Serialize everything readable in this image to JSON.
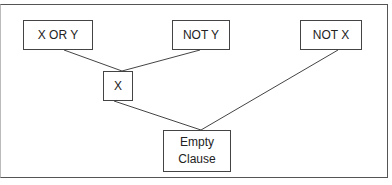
{
  "diagram": {
    "type": "resolution-tree",
    "nodes": [
      {
        "id": "x_or_y",
        "label": "X OR Y"
      },
      {
        "id": "not_y",
        "label": "NOT Y"
      },
      {
        "id": "not_x",
        "label": "NOT X"
      },
      {
        "id": "x",
        "label": "X"
      },
      {
        "id": "empty",
        "label_line1": "Empty",
        "label_line2": "Clause"
      }
    ],
    "edges": [
      {
        "from": "x_or_y",
        "to": "x"
      },
      {
        "from": "not_y",
        "to": "x"
      },
      {
        "from": "x",
        "to": "empty"
      },
      {
        "from": "not_x",
        "to": "empty"
      }
    ]
  }
}
